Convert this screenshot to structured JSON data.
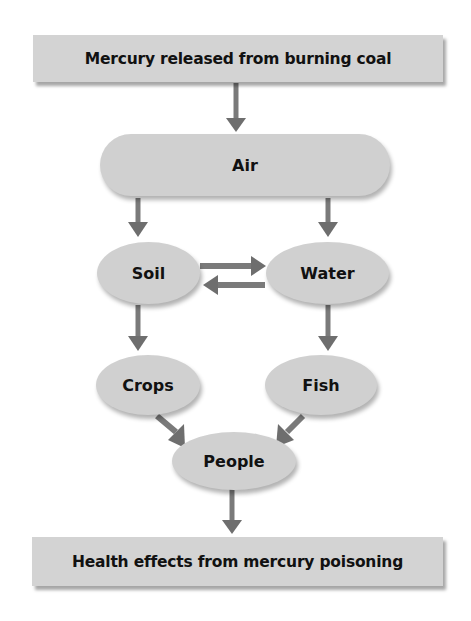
{
  "diagram": {
    "colors": {
      "box_fill": "#d3d3d3",
      "node_fill": "#d0d0d0",
      "arrow": "#6e6e6e",
      "text": "#111111"
    },
    "nodes": {
      "source": {
        "label": "Mercury released from burning coal",
        "shape": "rectangle"
      },
      "air": {
        "label": "Air",
        "shape": "rounded-ellipse"
      },
      "soil": {
        "label": "Soil",
        "shape": "ellipse"
      },
      "water": {
        "label": "Water",
        "shape": "ellipse"
      },
      "crops": {
        "label": "Crops",
        "shape": "ellipse"
      },
      "fish": {
        "label": "Fish",
        "shape": "ellipse"
      },
      "people": {
        "label": "People",
        "shape": "ellipse"
      },
      "outcome": {
        "label": "Health effects from mercury poisoning",
        "shape": "rectangle"
      }
    },
    "edges": [
      {
        "from": "source",
        "to": "air"
      },
      {
        "from": "air",
        "to": "soil"
      },
      {
        "from": "air",
        "to": "water"
      },
      {
        "from": "soil",
        "to": "water"
      },
      {
        "from": "water",
        "to": "soil"
      },
      {
        "from": "soil",
        "to": "crops"
      },
      {
        "from": "water",
        "to": "fish"
      },
      {
        "from": "crops",
        "to": "people"
      },
      {
        "from": "fish",
        "to": "people"
      },
      {
        "from": "people",
        "to": "outcome"
      }
    ]
  }
}
